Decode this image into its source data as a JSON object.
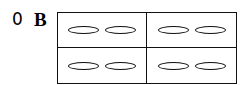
{
  "figure": {
    "index_label": "0",
    "panel_label": "B",
    "grid": {
      "rows": 2,
      "cols": 2,
      "cells": [
        {
          "ellipses": 2
        },
        {
          "ellipses": 2
        },
        {
          "ellipses": 2
        },
        {
          "ellipses": 2
        }
      ]
    }
  }
}
